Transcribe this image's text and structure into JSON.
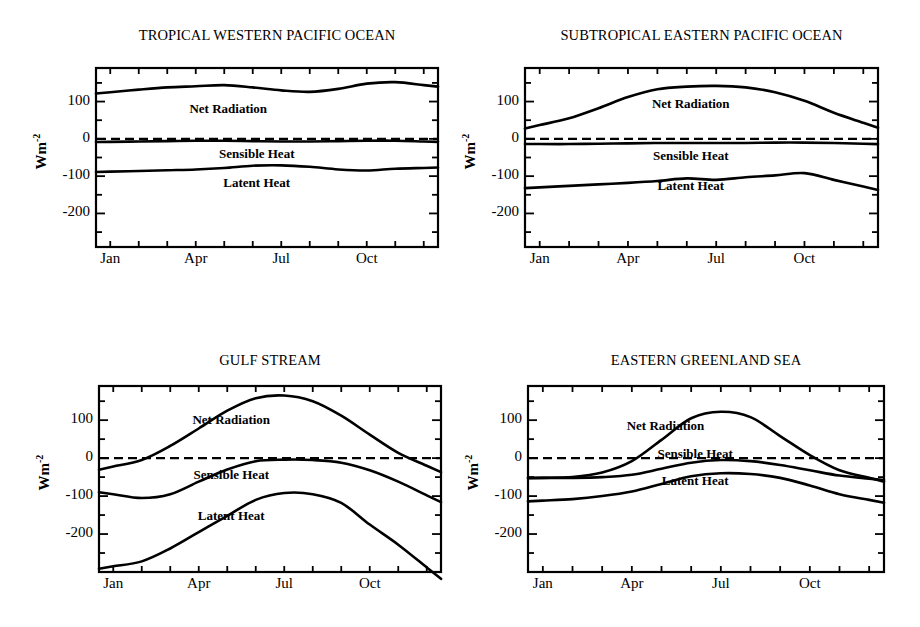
{
  "figure": {
    "y_axis_label": "Wm",
    "y_axis_exponent": "-2",
    "series_names": [
      "Net Radiation",
      "Sensible Heat",
      "Latent Heat"
    ],
    "month_ticks": [
      "Jan",
      "Apr",
      "Jul",
      "Oct"
    ],
    "y_ticks": [
      "100",
      "0",
      "-100",
      "-200"
    ],
    "line_color": "#000000",
    "zero_line_color": "#000000",
    "frame_color": "#000000"
  },
  "chart_data": [
    {
      "type": "line",
      "title": "TROPICAL WESTERN PACIFIC OCEAN",
      "xlabel": "",
      "ylabel": "Wm-2",
      "x": [
        "Jan",
        "Feb",
        "Mar",
        "Apr",
        "May",
        "Jun",
        "Jul",
        "Aug",
        "Sep",
        "Oct",
        "Nov",
        "Dec"
      ],
      "xtick_labels": [
        "Jan",
        "Apr",
        "Jul",
        "Oct"
      ],
      "ytick_labels": [
        "100",
        "0",
        "-100",
        "-200"
      ],
      "ylim": [
        -290,
        190
      ],
      "grid": false,
      "zero_reference_line": 0,
      "series": [
        {
          "name": "Net Radiation",
          "values": [
            125,
            132,
            138,
            141,
            144,
            138,
            130,
            126,
            134,
            148,
            152,
            144
          ],
          "label_x": "May",
          "label_y": 78
        },
        {
          "name": "Sensible Heat",
          "values": [
            -8,
            -7,
            -6,
            -5,
            -5,
            -6,
            -7,
            -7,
            -6,
            -5,
            -5,
            -7
          ],
          "label_x": "Jun",
          "label_y": -42
        },
        {
          "name": "Latent Heat",
          "values": [
            -88,
            -86,
            -84,
            -82,
            -78,
            -72,
            -71,
            -75,
            -82,
            -85,
            -80,
            -78
          ],
          "label_x": "Jun",
          "label_y": -122
        }
      ]
    },
    {
      "type": "line",
      "title": "SUBTROPICAL EASTERN PACIFIC OCEAN",
      "xlabel": "",
      "ylabel": "Wm-2",
      "x": [
        "Jan",
        "Feb",
        "Mar",
        "Apr",
        "May",
        "Jun",
        "Jul",
        "Aug",
        "Sep",
        "Oct",
        "Nov",
        "Dec"
      ],
      "xtick_labels": [
        "Jan",
        "Apr",
        "Jul",
        "Oct"
      ],
      "ytick_labels": [
        "100",
        "0",
        "-100",
        "-200"
      ],
      "ylim": [
        -290,
        190
      ],
      "grid": false,
      "zero_reference_line": 0,
      "series": [
        {
          "name": "Net Radiation",
          "values": [
            37,
            55,
            82,
            112,
            133,
            140,
            142,
            138,
            125,
            102,
            70,
            43
          ],
          "label_x": "Jun",
          "label_y": 92
        },
        {
          "name": "Sensible Heat",
          "values": [
            -14,
            -14,
            -13,
            -12,
            -11,
            -11,
            -11,
            -11,
            -10,
            -10,
            -11,
            -13
          ],
          "label_x": "Jun",
          "label_y": -48
        },
        {
          "name": "Latent Heat",
          "values": [
            -130,
            -126,
            -122,
            -118,
            -113,
            -106,
            -110,
            -103,
            -98,
            -92,
            -110,
            -128
          ],
          "label_x": "Jun",
          "label_y": -128
        }
      ]
    },
    {
      "type": "line",
      "title": "GULF STREAM",
      "xlabel": "",
      "ylabel": "Wm-2",
      "x": [
        "Jan",
        "Feb",
        "Mar",
        "Apr",
        "May",
        "Jun",
        "Jul",
        "Aug",
        "Sep",
        "Oct",
        "Nov",
        "Dec"
      ],
      "xtick_labels": [
        "Jan",
        "Apr",
        "Jul",
        "Oct"
      ],
      "ytick_labels": [
        "100",
        "0",
        "-100",
        "-200"
      ],
      "ylim": [
        -300,
        190
      ],
      "grid": false,
      "zero_reference_line": 0,
      "series": [
        {
          "name": "Net Radiation",
          "values": [
            -22,
            -5,
            32,
            78,
            125,
            158,
            165,
            150,
            112,
            62,
            14,
            -20
          ],
          "label_x": "May",
          "label_y": 97
        },
        {
          "name": "Sensible Heat",
          "values": [
            -95,
            -105,
            -95,
            -62,
            -30,
            -8,
            -4,
            -5,
            -12,
            -32,
            -62,
            -98
          ],
          "label_x": "May",
          "label_y": -48
        },
        {
          "name": "Latent Heat",
          "values": [
            -285,
            -272,
            -238,
            -195,
            -152,
            -110,
            -92,
            -95,
            -118,
            -175,
            -228,
            -288
          ],
          "label_x": "May",
          "label_y": -155
        }
      ]
    },
    {
      "type": "line",
      "title": "EASTERN GREENLAND SEA",
      "xlabel": "",
      "ylabel": "Wm-2",
      "x": [
        "Jan",
        "Feb",
        "Mar",
        "Apr",
        "May",
        "Jun",
        "Jul",
        "Aug",
        "Sep",
        "Oct",
        "Nov",
        "Dec"
      ],
      "xtick_labels": [
        "Jan",
        "Apr",
        "Jul",
        "Oct"
      ],
      "ytick_labels": [
        "100",
        "0",
        "-100",
        "-200"
      ],
      "ylim": [
        -300,
        190
      ],
      "grid": false,
      "zero_reference_line": 0,
      "series": [
        {
          "name": "Net Radiation",
          "values": [
            -52,
            -50,
            -38,
            -8,
            48,
            105,
            122,
            108,
            58,
            8,
            -32,
            -52
          ],
          "label_x": "May",
          "label_y": 82
        },
        {
          "name": "Sensible Heat",
          "values": [
            -52,
            -52,
            -50,
            -44,
            -28,
            -12,
            -5,
            -8,
            -18,
            -32,
            -46,
            -54
          ],
          "label_x": "Jun",
          "label_y": 8
        },
        {
          "name": "Latent Heat",
          "values": [
            -112,
            -108,
            -100,
            -88,
            -68,
            -48,
            -40,
            -42,
            -52,
            -72,
            -95,
            -110
          ],
          "label_x": "Jun",
          "label_y": -62
        }
      ]
    }
  ]
}
